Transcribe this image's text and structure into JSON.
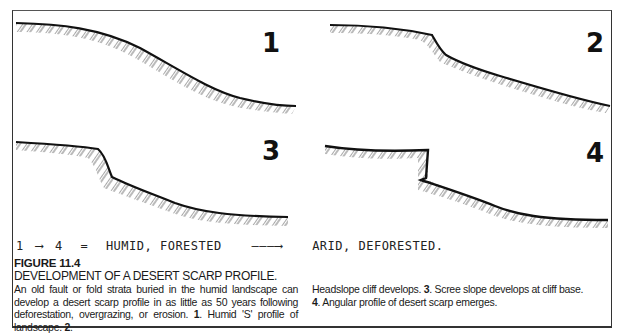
{
  "figure": {
    "label": "FIGURE 11.4",
    "title": "DEVELOPMENT OF A DESERT SCARP  PROFILE.",
    "caption_left": {
      "text": "An old fault or fold strata buried in the humid landscape can develop a desert scarp profile in as little as 50 years following deforestation, overgrazing, or erosion. ",
      "item1_num": "1",
      "item1_text": ". Humid 'S' profile of landscape. ",
      "item2_num": "2",
      "item2_text": "."
    },
    "caption_right": {
      "item2_cont": "Headslope cliff develops. ",
      "item3_num": "3",
      "item3_text": ". Scree slope develops at cliff base.",
      "item4_num": "4",
      "item4_text": ". Angular profile of desert scarp emerges."
    }
  },
  "panels": [
    {
      "number": "1",
      "description": "Humid S-shaped smooth profile"
    },
    {
      "number": "2",
      "description": "Headslope cliff develops"
    },
    {
      "number": "3",
      "description": "Scree slope at cliff base"
    },
    {
      "number": "4",
      "description": "Angular desert scarp profile"
    }
  ],
  "handwritten_note": {
    "start": "1",
    "arrow1": "⟶",
    "end": "4",
    "equals": "=",
    "from_state": "HUMID, FORESTED",
    "arrow2": "———⟶",
    "to_state": "ARID, DEFORESTED."
  }
}
